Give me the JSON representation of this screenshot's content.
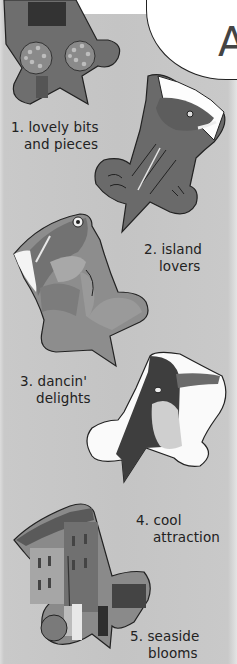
{
  "header": {
    "bubble_letter": "A"
  },
  "items": [
    {
      "number": "1.",
      "line1": "1. lovely bits",
      "line2": "and pieces",
      "icon": "village-painting-star"
    },
    {
      "number": "2.",
      "line1": "2. island",
      "line2": "lovers",
      "icon": "shark-painting-star"
    },
    {
      "number": "3.",
      "line1": "3. dancin'",
      "line2": "delights",
      "icon": "fish-dancer-painting-star"
    },
    {
      "number": "4.",
      "line1": "4. cool",
      "line2": "attraction",
      "icon": "penguin-painting-star"
    },
    {
      "number": "5.",
      "line1": "5. seaside",
      "line2": "blooms",
      "icon": "street-photo-star"
    }
  ],
  "colors": {
    "background": "#c6c6c6",
    "outline": "#222222",
    "text": "#222222"
  }
}
